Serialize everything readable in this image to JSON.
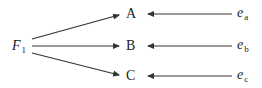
{
  "diagram": {
    "type": "path-diagram",
    "factor": {
      "symbol": "F",
      "subscript": "1"
    },
    "nodes": [
      {
        "id": "A",
        "label": "A",
        "error": {
          "symbol": "e",
          "subscript": "a"
        }
      },
      {
        "id": "B",
        "label": "B",
        "error": {
          "symbol": "e",
          "subscript": "b"
        }
      },
      {
        "id": "C",
        "label": "C",
        "error": {
          "symbol": "e",
          "subscript": "c"
        }
      }
    ],
    "edges": [
      {
        "from": "F1",
        "to": "A"
      },
      {
        "from": "F1",
        "to": "B"
      },
      {
        "from": "F1",
        "to": "C"
      },
      {
        "from": "e_a",
        "to": "A"
      },
      {
        "from": "e_b",
        "to": "B"
      },
      {
        "from": "e_c",
        "to": "C"
      }
    ],
    "colors": {
      "line": "#333333",
      "text": "#222222"
    }
  }
}
